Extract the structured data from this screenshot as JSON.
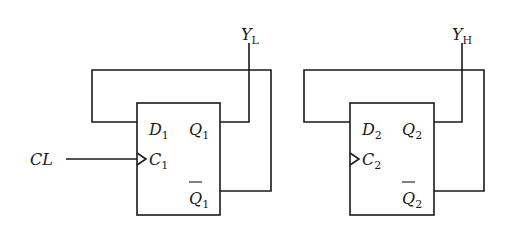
{
  "diagram": {
    "type": "circuit",
    "clock_input": {
      "label": "CL"
    },
    "flip_flops": [
      {
        "id": "FF1",
        "d": {
          "main": "D",
          "sub": "1"
        },
        "c": {
          "main": "C",
          "sub": "1"
        },
        "q": {
          "main": "Q",
          "sub": "1"
        },
        "qbar": {
          "main": "Q",
          "sub": "1"
        },
        "output": {
          "main": "Y",
          "sub": "L"
        }
      },
      {
        "id": "FF2",
        "d": {
          "main": "D",
          "sub": "2"
        },
        "c": {
          "main": "C",
          "sub": "2"
        },
        "q": {
          "main": "Q",
          "sub": "2"
        },
        "qbar": {
          "main": "Q",
          "sub": "2"
        },
        "output": {
          "main": "Y",
          "sub": "H"
        }
      }
    ],
    "colors": {
      "line": "#1a1a1a",
      "background": "#ffffff"
    }
  }
}
